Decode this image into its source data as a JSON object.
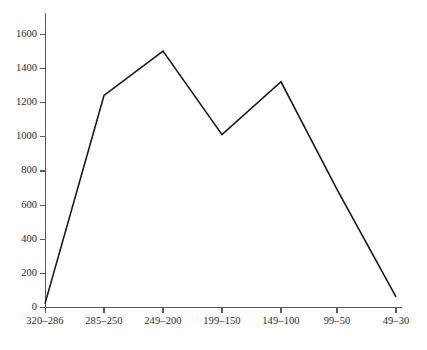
{
  "chart_data": {
    "type": "line",
    "title": "",
    "subtitle": "",
    "xlabel": "",
    "ylabel": "",
    "categories": [
      "320–286",
      "285–250",
      "249–200",
      "199–150",
      "149–100",
      "99–50",
      "49–30"
    ],
    "values": [
      20,
      1240,
      1500,
      1010,
      1320,
      690,
      60
    ],
    "series": [
      {
        "name": "",
        "values": [
          20,
          1240,
          1500,
          1010,
          1320,
          690,
          60
        ]
      }
    ],
    "ylim": [
      0,
      1700
    ],
    "yticks": [
      0,
      200,
      400,
      600,
      800,
      1000,
      1200,
      1400,
      1600
    ],
    "ytick_labels": [
      "0",
      "200",
      "400",
      "600",
      "800",
      "1000",
      "1200",
      "1400",
      "1600"
    ],
    "xtick_labels": [
      "320–286",
      "285–250",
      "249–200",
      "199–150",
      "149–100",
      "99–50",
      "49–30"
    ],
    "grid": false,
    "legend": null,
    "legend_position": "none",
    "annotations": [],
    "line_color": "#151515",
    "axis_color": "#5a5a5a",
    "background_color": "#ffffff",
    "vertex_markers": false
  },
  "layout": {
    "plot_left": 45,
    "plot_right": 400,
    "axis_top": 13,
    "baseline_y": 307,
    "y_value_top": 34,
    "y_value_top_value": 1600,
    "x_tick_positions": [
      45,
      104,
      163,
      222,
      281,
      337,
      396
    ]
  }
}
